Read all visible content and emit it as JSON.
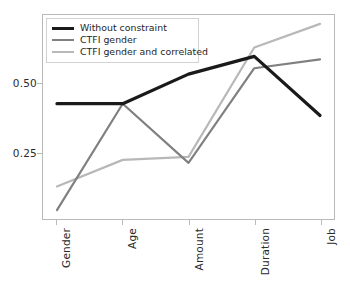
{
  "chart_data": {
    "type": "line",
    "title": "",
    "xlabel": "",
    "ylabel": "",
    "categories": [
      "Gender",
      "Age",
      "Amount",
      "Duration",
      "Job"
    ],
    "yticks": [
      0.25,
      0.5
    ],
    "ytick_labels": [
      "0.25",
      "0.50"
    ],
    "ylim": [
      0.04,
      0.73
    ],
    "grid": false,
    "legend_position": "upper left",
    "series": [
      {
        "name": "Without constraint",
        "color": "#1a1a1a",
        "linewidth": 3.2,
        "values": [
          0.43,
          0.43,
          0.53,
          0.59,
          0.39
        ]
      },
      {
        "name": "CTFI gender",
        "color": "#808080",
        "linewidth": 2.2,
        "values": [
          0.07,
          0.43,
          0.23,
          0.55,
          0.58
        ]
      },
      {
        "name": "CTFI gender and correlated",
        "color": "#b8b8b8",
        "linewidth": 2.2,
        "values": [
          0.15,
          0.24,
          0.25,
          0.62,
          0.7
        ]
      }
    ]
  },
  "axes": {
    "frame_color": "#b9b9b9",
    "tick_color": "#b9b9b9",
    "label_color": "#2b2b2b"
  }
}
